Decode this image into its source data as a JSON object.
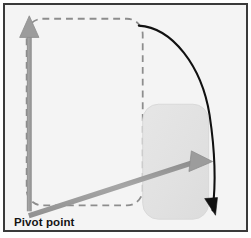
{
  "figure": {
    "type": "technical-illustration",
    "frame": {
      "border_color": "#3a3a3a",
      "background_color": "#f4f4f4",
      "outer_background": "#ffffff",
      "border_width_px": 2
    },
    "labels": {
      "pivot_point": "Pivot point"
    },
    "colors": {
      "gray_arrow": "#9a9a9a",
      "gray_arrow_dark_edge": "#8a8a8a",
      "dashed_outline": "#8d8d8d",
      "filled_shape": "#e2e2e2",
      "filled_shape_edge": "#d4d4d4",
      "rotation_arrow": "#111111",
      "label_text": "#141414"
    },
    "elements": [
      {
        "name": "original-shape-outline",
        "kind": "rounded-rectangle",
        "style": "dashed",
        "x": 25,
        "y": 17,
        "width": 118,
        "height": 190,
        "corner_radius": 16,
        "stroke": "#8d8d8d",
        "dash_pattern": "7 5"
      },
      {
        "name": "rotated-shape",
        "kind": "rounded-rectangle",
        "style": "filled",
        "x": 143,
        "y": 104,
        "width": 67,
        "height": 117,
        "corner_radius": 16,
        "fill": "#e2e2e2"
      },
      {
        "name": "vertical-reference-arrow",
        "kind": "arrow",
        "from": [
          28,
          212
        ],
        "to": [
          28,
          22
        ],
        "color": "#9a9a9a",
        "direction": "up"
      },
      {
        "name": "rotated-reference-arrow",
        "kind": "arrow",
        "from": [
          28,
          212
        ],
        "to": [
          211,
          161
        ],
        "color": "#9a9a9a",
        "direction": "up-right"
      },
      {
        "name": "rotation-direction-arrow",
        "kind": "curved-arrow",
        "from": [
          140,
          24
        ],
        "to": [
          214,
          216
        ],
        "color": "#111111",
        "sweep": "clockwise"
      },
      {
        "name": "pivot-point-marker",
        "kind": "vertex",
        "at": [
          28,
          212
        ]
      }
    ]
  }
}
